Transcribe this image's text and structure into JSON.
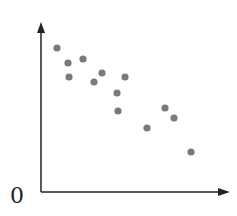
{
  "chart_data": {
    "type": "scatter",
    "title": "",
    "xlabel": "",
    "ylabel": "",
    "origin_label": "0",
    "grid": false,
    "legend": null,
    "point_color": "#7a7a7a",
    "axis_color": "#222222",
    "points_px": [
      [
        57,
        48
      ],
      [
        68,
        63
      ],
      [
        83,
        59
      ],
      [
        69,
        77
      ],
      [
        94,
        82
      ],
      [
        102,
        73
      ],
      [
        125,
        77
      ],
      [
        117,
        93
      ],
      [
        118,
        111
      ],
      [
        147,
        128
      ],
      [
        165,
        108
      ],
      [
        174,
        118
      ],
      [
        191,
        152
      ]
    ],
    "points": [
      {
        "x": 1.6,
        "y": 8.7
      },
      {
        "x": 2.7,
        "y": 7.8
      },
      {
        "x": 4.2,
        "y": 8.1
      },
      {
        "x": 2.8,
        "y": 6.9
      },
      {
        "x": 5.3,
        "y": 6.6
      },
      {
        "x": 6.1,
        "y": 7.1
      },
      {
        "x": 8.4,
        "y": 6.9
      },
      {
        "x": 7.6,
        "y": 5.9
      },
      {
        "x": 7.7,
        "y": 4.9
      },
      {
        "x": 10.6,
        "y": 3.9
      },
      {
        "x": 12.4,
        "y": 5.1
      },
      {
        "x": 13.3,
        "y": 4.5
      },
      {
        "x": 15.0,
        "y": 2.4
      }
    ],
    "trend": "negative correlation"
  }
}
